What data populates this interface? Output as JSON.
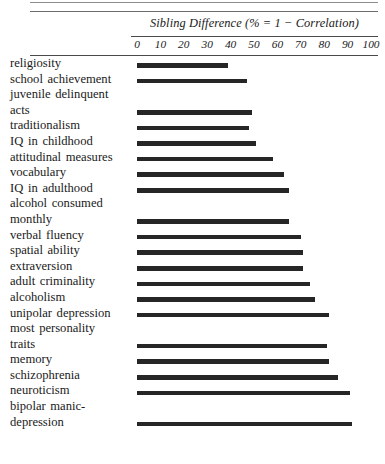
{
  "figure": {
    "axis_title": "Sibling Difference (% = 1 − Correlation)",
    "tick_labels": [
      "0",
      "10",
      "20",
      "30",
      "40",
      "50",
      "60",
      "70",
      "80",
      "90",
      "100"
    ],
    "bar_color": "#262626",
    "rule_color": "#4a4a4a"
  },
  "chart_data": {
    "type": "bar",
    "orientation": "horizontal",
    "title": "Sibling Difference (% = 1 − Correlation)",
    "xlabel": "Sibling Difference (% = 1 − Correlation)",
    "ylabel": "",
    "xlim": [
      0,
      100
    ],
    "xticks": [
      0,
      10,
      20,
      30,
      40,
      50,
      60,
      70,
      80,
      90,
      100
    ],
    "grid": false,
    "legend": null,
    "categories": [
      "religiosity",
      "school achievement",
      "juvenile delinquent acts",
      "traditionalism",
      "IQ in childhood",
      "attitudinal measures",
      "vocabulary",
      "IQ in adulthood",
      "alcohol consumed monthly",
      "verbal fluency",
      "spatial ability",
      "extraversion",
      "adult criminality",
      "alcoholism",
      "unipolar depression",
      "most personality traits",
      "memory",
      "schizophrenia",
      "neuroticism",
      "bipolar manic-depression"
    ],
    "values": [
      39,
      47,
      49,
      48,
      51,
      58,
      63,
      65,
      65,
      70,
      71,
      71,
      74,
      76,
      82,
      81,
      82,
      86,
      91,
      92
    ]
  },
  "rows": [
    {
      "label_lines": [
        "religiosity"
      ],
      "value": 39
    },
    {
      "label_lines": [
        "school achievement"
      ],
      "value": 47
    },
    {
      "label_lines": [
        "juvenile delinquent",
        "acts"
      ],
      "value": 49
    },
    {
      "label_lines": [
        "traditionalism"
      ],
      "value": 48
    },
    {
      "label_lines": [
        "IQ in childhood"
      ],
      "value": 51
    },
    {
      "label_lines": [
        "attitudinal measures"
      ],
      "value": 58
    },
    {
      "label_lines": [
        "vocabulary"
      ],
      "value": 63
    },
    {
      "label_lines": [
        "IQ in adulthood"
      ],
      "value": 65
    },
    {
      "label_lines": [
        "alcohol consumed",
        "monthly"
      ],
      "value": 65
    },
    {
      "label_lines": [
        "verbal fluency"
      ],
      "value": 70
    },
    {
      "label_lines": [
        "spatial ability"
      ],
      "value": 71
    },
    {
      "label_lines": [
        "extraversion"
      ],
      "value": 71
    },
    {
      "label_lines": [
        "adult criminality"
      ],
      "value": 74
    },
    {
      "label_lines": [
        "alcoholism"
      ],
      "value": 76
    },
    {
      "label_lines": [
        "unipolar depression"
      ],
      "value": 82
    },
    {
      "label_lines": [
        "most personality",
        "traits"
      ],
      "value": 81
    },
    {
      "label_lines": [
        "memory"
      ],
      "value": 82
    },
    {
      "label_lines": [
        "schizophrenia"
      ],
      "value": 86
    },
    {
      "label_lines": [
        "neuroticism"
      ],
      "value": 91
    },
    {
      "label_lines": [
        "bipolar manic-",
        "depression"
      ],
      "value": 92
    }
  ]
}
